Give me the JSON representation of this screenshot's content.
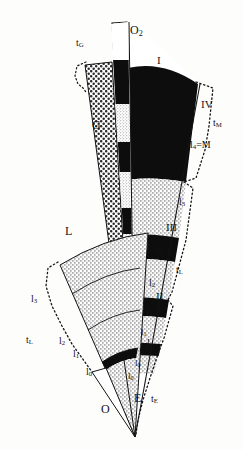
{
  "figure": {
    "type": "technical-line-diagram",
    "background_color": "#fdfdfc",
    "ink_color": "#141414",
    "fill_black": "#0d0d0d",
    "fill_stipple_dark": "#d8d8d4",
    "fill_stipple_light": "#e6e6e2",
    "fill_white": "#ffffff",
    "apex": {
      "x": 135,
      "y": 437
    }
  },
  "labels": {
    "t_G": {
      "text": "t",
      "sub": "G",
      "x": 78,
      "y": 43
    },
    "O2": {
      "text": "O",
      "sub": "2",
      "x": 133,
      "y": 30
    },
    "G": {
      "text": "G",
      "x": 94,
      "y": 125
    },
    "I_top": {
      "text": "I",
      "x": 158,
      "y": 62
    },
    "IV": {
      "text": "IV",
      "x": 203,
      "y": 105
    },
    "t_M": {
      "text": "t",
      "sub": "M",
      "x": 214,
      "y": 124
    },
    "l4_eq_M": {
      "text": "l",
      "sub": "4",
      "suffix": "=M",
      "x": 192,
      "y": 146
    },
    "l3_right_upper": {
      "text": "l",
      "sub": "3",
      "x": 180,
      "y": 203
    },
    "III": {
      "text": "III",
      "x": 168,
      "y": 228
    },
    "l3_right_lower": {
      "text": "l",
      "sub": "3",
      "x": 157,
      "y": 250
    },
    "t_L_right": {
      "text": "t",
      "sub": "L",
      "x": 177,
      "y": 271
    },
    "l2_right_upper": {
      "text": "l",
      "sub": "2",
      "x": 150,
      "y": 284
    },
    "II": {
      "text": "II",
      "x": 157,
      "y": 297
    },
    "l2_right_lower": {
      "text": "l",
      "sub": "2",
      "x": 147,
      "y": 312
    },
    "l1_right": {
      "text": "l",
      "sub": "1",
      "x": 142,
      "y": 333
    },
    "I_right": {
      "text": "I",
      "x": 145,
      "y": 344
    },
    "l1_right_lower": {
      "text": "l",
      "sub": "1",
      "x": 140,
      "y": 352
    },
    "l0_right_upper": {
      "text": "l",
      "sub": "0",
      "x": 136,
      "y": 364
    },
    "l0_right_lower": {
      "text": "l",
      "sub": "0",
      "x": 129,
      "y": 377
    },
    "E": {
      "text": "E",
      "x": 136,
      "y": 398
    },
    "t_E": {
      "text": "t",
      "sub": "E",
      "x": 152,
      "y": 399
    },
    "L": {
      "text": "L",
      "x": 67,
      "y": 231
    },
    "l3_left": {
      "text": "l",
      "sub": "3",
      "x": 32,
      "y": 300
    },
    "t_L_left": {
      "text": "t",
      "sub": "L",
      "x": 27,
      "y": 341
    },
    "l2_left": {
      "text": "l",
      "sub": "2",
      "x": 60,
      "y": 342
    },
    "l1_left": {
      "text": "l",
      "sub": "1",
      "x": 74,
      "y": 355
    },
    "l0_left": {
      "text": "l",
      "sub": "0",
      "x": 87,
      "y": 373
    },
    "O": {
      "text": "O",
      "x": 103,
      "y": 409
    }
  },
  "wedges": {
    "G": {
      "name": "G",
      "fill": "coarse-stipple",
      "description": "left tall narrow wedge, coarse dotted texture"
    },
    "O2": {
      "name": "O2",
      "fill": "white",
      "description": "narrow white sliver wedge at top center"
    },
    "center_column": {
      "name": "center-column",
      "description": "vertical stack of alternating black and fine-stipple bands",
      "bands": [
        {
          "fill": "black",
          "from": 0.0,
          "to": 0.12
        },
        {
          "fill": "stipple",
          "from": 0.12,
          "to": 0.22
        },
        {
          "fill": "black",
          "from": 0.22,
          "to": 0.3
        },
        {
          "fill": "stipple",
          "from": 0.3,
          "to": 0.4
        },
        {
          "fill": "black",
          "from": 0.4,
          "to": 0.46
        },
        {
          "fill": "stipple",
          "from": 0.46,
          "to": 0.56
        },
        {
          "fill": "black",
          "from": 0.56,
          "to": 0.6
        },
        {
          "fill": "stipple",
          "from": 0.6,
          "to": 0.68
        },
        {
          "fill": "black",
          "from": 0.68,
          "to": 0.71
        },
        {
          "fill": "stipple",
          "from": 0.71,
          "to": 0.76
        },
        {
          "fill": "black",
          "from": 0.76,
          "to": 0.78
        }
      ]
    },
    "sector_I_IV": {
      "name": "sectors-I-to-IV",
      "description": "right-hand wide sector, black top (IV) then stipple bands, bounded by dotted outline",
      "roman_levels": [
        "I",
        "II",
        "III",
        "IV"
      ]
    },
    "L": {
      "name": "L",
      "fill": "fine-stipple",
      "description": "lower-left broad fan with 3 concentric arc divisions"
    },
    "O": {
      "name": "O",
      "fill": "white",
      "description": "narrow white wedge at bottom left of apex"
    }
  }
}
